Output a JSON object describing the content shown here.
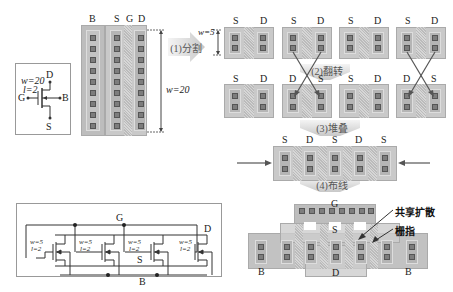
{
  "symbol": {
    "w_label": "w=20",
    "l_label": "l=2",
    "terminals": {
      "drain": "D",
      "gate": "G",
      "body": "B",
      "source": "S"
    }
  },
  "original_layout": {
    "column_labels": [
      "B",
      "S",
      "G",
      "D"
    ],
    "width_label": "w=20",
    "contact_rows": 9
  },
  "steps": [
    {
      "id": 1,
      "label": "(1)分割"
    },
    {
      "id": 2,
      "label": "(2)翻转"
    },
    {
      "id": 3,
      "label": "(3)堆叠"
    },
    {
      "id": 4,
      "label": "(4)布线"
    }
  ],
  "split_row": {
    "width_label": "w=5",
    "fingers": [
      {
        "left": "S",
        "right": "D"
      },
      {
        "left": "S",
        "right": "D"
      },
      {
        "left": "S",
        "right": "D"
      },
      {
        "left": "S",
        "right": "D"
      }
    ]
  },
  "flipped_row": {
    "fingers": [
      {
        "left": "S",
        "right": "D"
      },
      {
        "left": "D",
        "right": "S"
      },
      {
        "left": "S",
        "right": "D"
      },
      {
        "left": "D",
        "right": "S"
      }
    ]
  },
  "stacked_row": {
    "labels": [
      "S",
      "D",
      "S",
      "D",
      "S"
    ]
  },
  "routed_layout": {
    "gate_label": "G",
    "source_label": "S",
    "drain_label": "D",
    "body_labels": [
      "B",
      "B"
    ],
    "annotations": [
      "共享扩散",
      "栅指"
    ]
  },
  "schematic": {
    "net_labels": {
      "gate": "G",
      "drain": "D",
      "source": "S",
      "body": "B"
    },
    "transistors": [
      {
        "w": "w=5",
        "l": "l=2"
      },
      {
        "w": "w=5",
        "l": "l=2"
      },
      {
        "w": "w=5",
        "l": "l=2"
      },
      {
        "w": "w=5",
        "l": "l=2"
      }
    ]
  }
}
